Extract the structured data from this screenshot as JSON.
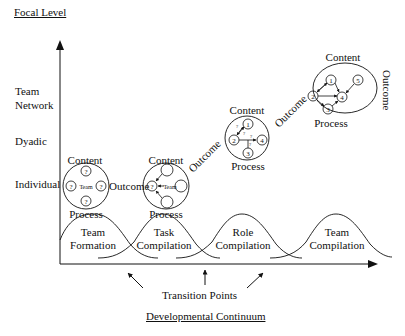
{
  "y_axis": {
    "title": "Focal Level",
    "levels": [
      "Team Network",
      "Dyadic",
      "Individual"
    ],
    "level_lines": [
      [
        "Team",
        "Network"
      ],
      [
        "Dyadic"
      ],
      [
        "Individual"
      ]
    ]
  },
  "x_axis": {
    "title": "Developmental Continuum",
    "transition_label": "Transition Points"
  },
  "phases": [
    {
      "line1": "Team",
      "line2": "Formation"
    },
    {
      "line1": "Task",
      "line2": "Compilation"
    },
    {
      "line1": "Role",
      "line2": "Compilation"
    },
    {
      "line1": "Team",
      "line2": "Compilation"
    }
  ],
  "stages": {
    "content_label": "Content",
    "process_label": "Process",
    "outcome_label": "Outcome",
    "team_label": "Team",
    "unknown_glyph": "?",
    "stage1": {
      "nodes": [
        "?",
        "?",
        "?",
        "?"
      ]
    },
    "stage2": {
      "nodes": [
        "?",
        "",
        "",
        ""
      ]
    },
    "stage3": {
      "nodes": [
        "1",
        "2",
        "3",
        "4"
      ],
      "edge_labels": [
        "?",
        "?",
        "?",
        "?"
      ]
    },
    "stage4": {
      "nodes": [
        "1",
        "2",
        "3",
        "4",
        "5"
      ]
    }
  }
}
